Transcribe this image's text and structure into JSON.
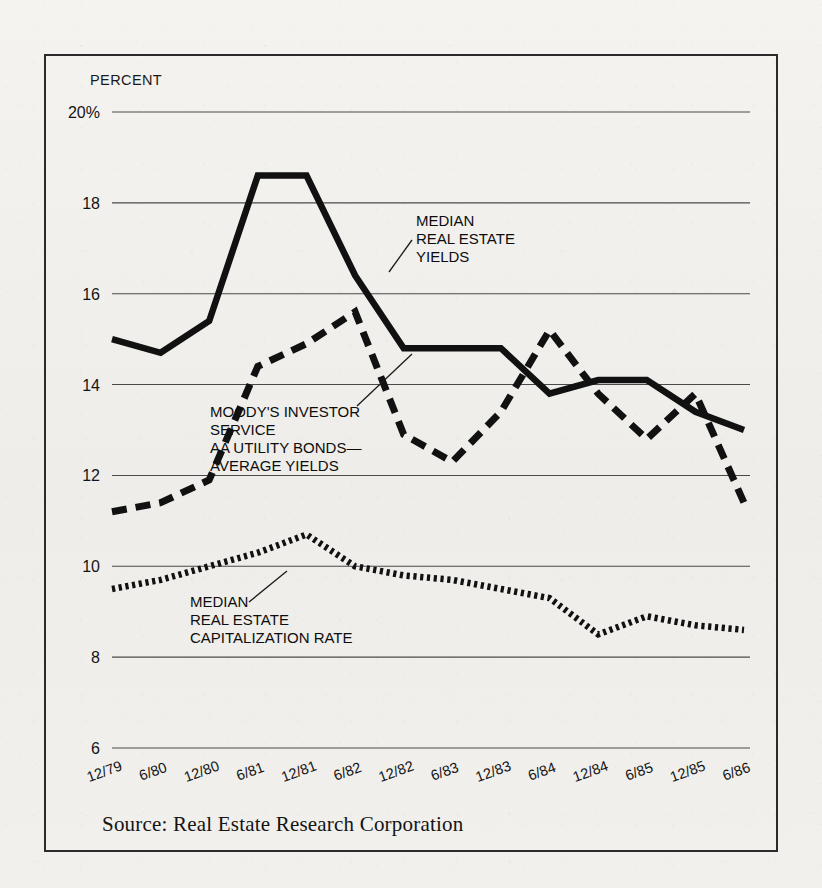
{
  "figure": {
    "axis_label": "PERCENT",
    "source_note": "Source: Real Estate Research Corporation"
  },
  "annotations": {
    "yields": [
      "MEDIAN",
      "REAL ESTATE",
      "YIELDS"
    ],
    "bonds": [
      "MOODY'S INVESTOR",
      "SERVICE",
      "AA UTILITY BONDS—",
      "AVERAGE YIELDS"
    ],
    "caprate": [
      "MEDIAN",
      "REAL ESTATE",
      "CAPITALIZATION RATE"
    ]
  },
  "chart_data": {
    "type": "line",
    "title": "",
    "xlabel": "",
    "ylabel": "PERCENT",
    "ylim": [
      6,
      20
    ],
    "yticks": [
      "6",
      "8",
      "10",
      "12",
      "14",
      "16",
      "18",
      "20%"
    ],
    "ytick_values": [
      6,
      8,
      10,
      12,
      14,
      16,
      18,
      20
    ],
    "grid": "horizontal",
    "legend": "inline-annotations",
    "categories": [
      "12/79",
      "6/80",
      "12/80",
      "6/81",
      "12/81",
      "6/82",
      "12/82",
      "6/83",
      "12/83",
      "6/84",
      "12/84",
      "6/85",
      "12/85",
      "6/86"
    ],
    "series": [
      {
        "name": "MEDIAN REAL ESTATE YIELDS",
        "style": "solid",
        "values": [
          15.0,
          14.7,
          15.4,
          18.6,
          18.6,
          16.4,
          14.8,
          14.8,
          14.8,
          13.8,
          14.1,
          14.1,
          13.4,
          13.0
        ]
      },
      {
        "name": "MOODY'S INVESTOR SERVICE AA UTILITY BONDS—AVERAGE YIELDS",
        "style": "dashed",
        "values": [
          11.2,
          11.4,
          11.9,
          14.4,
          14.9,
          15.6,
          12.9,
          12.3,
          13.4,
          15.2,
          13.8,
          12.8,
          13.8,
          11.4
        ]
      },
      {
        "name": "MEDIAN REAL ESTATE CAPITALIZATION RATE",
        "style": "dotted",
        "values": [
          9.5,
          9.7,
          10.0,
          10.3,
          10.7,
          10.0,
          9.8,
          9.7,
          9.5,
          9.3,
          8.5,
          8.9,
          8.7,
          8.6
        ]
      }
    ],
    "series_extra_points": {
      "bonds_tail": [
        11.4,
        10.3,
        9.2
      ],
      "caprate_tail": [
        8.6,
        8.6,
        8.6
      ],
      "yields_tail": [
        13.0
      ]
    }
  }
}
